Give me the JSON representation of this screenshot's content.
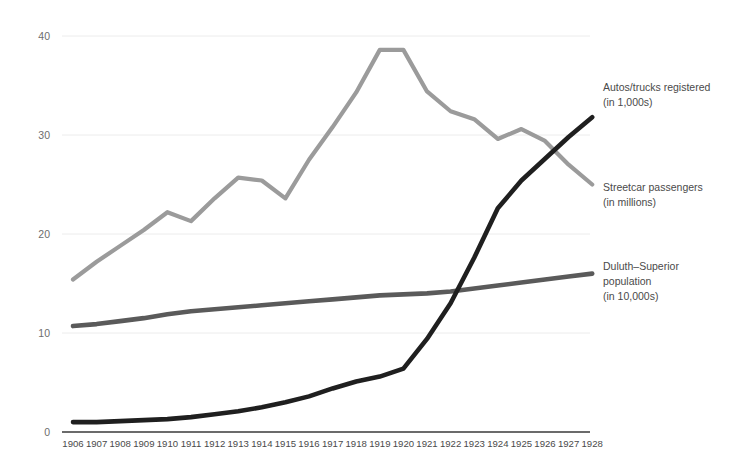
{
  "chart_data": {
    "type": "line",
    "title": "",
    "subtitle": "",
    "xlabel": "",
    "ylabel": "",
    "grid": true,
    "legend_position": "right-inline",
    "categories": [
      "1906",
      "1907",
      "1908",
      "1909",
      "1910",
      "1911",
      "1912",
      "1913",
      "1914",
      "1915",
      "1916",
      "1917",
      "1918",
      "1919",
      "1920",
      "1921",
      "1922",
      "1923",
      "1924",
      "1925",
      "1926",
      "1927",
      "1928"
    ],
    "yticks": [
      0,
      10,
      20,
      30,
      40
    ],
    "ylim": [
      0,
      41
    ],
    "series": [
      {
        "name": "Streetcar passengers (in millions)",
        "color": "#9b9b9b",
        "values": [
          15.4,
          17.2,
          18.8,
          20.4,
          22.2,
          21.3,
          23.6,
          25.7,
          25.4,
          23.6,
          27.5,
          30.8,
          34.3,
          38.6,
          38.6,
          34.4,
          32.4,
          31.6,
          29.6,
          30.6,
          29.4,
          27.0,
          25.0
        ]
      },
      {
        "name": "Duluth–Superior population (in 10,000s)",
        "color": "#5a5a5a",
        "values": [
          10.7,
          10.9,
          11.2,
          11.5,
          11.9,
          12.2,
          12.4,
          12.6,
          12.8,
          13.0,
          13.2,
          13.4,
          13.6,
          13.8,
          13.9,
          14.0,
          14.2,
          14.5,
          14.8,
          15.1,
          15.4,
          15.7,
          16.0
        ]
      },
      {
        "name": "Autos/trucks registered (in 1,000s)",
        "color": "#1f1f1f",
        "values": [
          1.0,
          1.0,
          1.1,
          1.2,
          1.3,
          1.5,
          1.8,
          2.1,
          2.5,
          3.0,
          3.6,
          4.4,
          5.1,
          5.6,
          6.4,
          9.4,
          13.0,
          17.6,
          22.6,
          25.4,
          27.6,
          29.8,
          31.8
        ]
      }
    ],
    "annotations": [
      {
        "id": "autos-trucks",
        "line1": "Autos/trucks registered",
        "line2": "(in 1,000s)",
        "x": 603,
        "y": 80
      },
      {
        "id": "streetcar",
        "line1": "Streetcar passengers",
        "line2": "(in millions)",
        "x": 603,
        "y": 180
      },
      {
        "id": "population",
        "line1": "Duluth–Superior",
        "line2": "population",
        "line3": "(in 10,000s)",
        "x": 603,
        "y": 259
      }
    ]
  },
  "layout": {
    "plot_left": 62,
    "plot_right": 590,
    "plot_top": 36,
    "plot_bottom": 432,
    "x_first": 73,
    "x_step": 23.6
  }
}
